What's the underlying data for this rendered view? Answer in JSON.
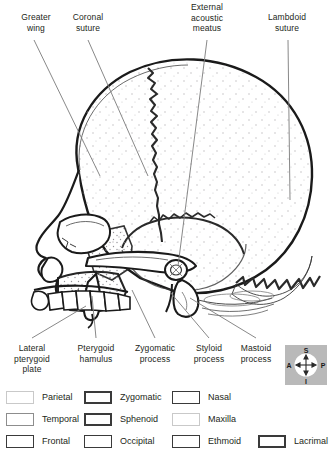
{
  "diagram": {
    "top_labels": [
      {
        "id": "greater-wing",
        "text": "Greater\nwing",
        "x": 10,
        "y": 12,
        "w": 52
      },
      {
        "id": "coronal-suture",
        "text": "Coronal\nsuture",
        "x": 62,
        "y": 12,
        "w": 52
      },
      {
        "id": "external-acoustic-meatus",
        "text": "External\nacoustic\nmeatus",
        "x": 178,
        "y": 2,
        "w": 58
      },
      {
        "id": "lambdoid-suture",
        "text": "Lambdoid\nsuture",
        "x": 258,
        "y": 12,
        "w": 58
      }
    ],
    "bottom_labels": [
      {
        "id": "lateral-pterygoid-plate",
        "text": "Lateral\npterygoid\nplate",
        "x": 6,
        "y": 343,
        "w": 52
      },
      {
        "id": "pterygoid-hamulus",
        "text": "Pterygoid\nhamulus",
        "x": 68,
        "y": 343,
        "w": 56
      },
      {
        "id": "zygomatic-process",
        "text": "Zygomatic\nprocess",
        "x": 127,
        "y": 343,
        "w": 56
      },
      {
        "id": "styloid-process",
        "text": "Styloid\nprocess",
        "x": 186,
        "y": 343,
        "w": 46
      },
      {
        "id": "mastoid-process",
        "text": "Mastoid\nprocess",
        "x": 231,
        "y": 343,
        "w": 50
      }
    ]
  },
  "compass": {
    "superior": "S",
    "inferior": "I",
    "anterior": "A",
    "posterior": "P"
  },
  "legend": {
    "rows": [
      [
        {
          "id": "parietal",
          "label": "Parietal",
          "swatch": "sw-light",
          "x": 6,
          "tx": 0
        },
        {
          "id": "zygomatic",
          "label": "Zygomatic",
          "swatch": "sw-heavy",
          "x": 84,
          "tx": 0
        },
        {
          "id": "nasal",
          "label": "Nasal",
          "swatch": "sw-dark",
          "x": 172,
          "tx": 0
        }
      ],
      [
        {
          "id": "temporal",
          "label": "Temporal",
          "swatch": "sw-mid",
          "x": 6,
          "tx": 0
        },
        {
          "id": "sphenoid",
          "label": "Sphenoid",
          "swatch": "sw-heavy",
          "x": 84,
          "tx": 0
        },
        {
          "id": "maxilla",
          "label": "Maxilla",
          "swatch": "sw-light",
          "x": 172,
          "tx": 0
        }
      ],
      [
        {
          "id": "frontal",
          "label": "Frontal",
          "swatch": "sw-dark",
          "x": 6,
          "tx": 0
        },
        {
          "id": "occipital",
          "label": "Occipital",
          "swatch": "sw-dark",
          "x": 84,
          "tx": 0
        },
        {
          "id": "ethmoid",
          "label": "Ethmoid",
          "swatch": "sw-dark",
          "x": 172,
          "tx": 0
        },
        {
          "id": "lacrimal",
          "label": "Lacrimal",
          "swatch": "sw-heavy",
          "x": 258,
          "tx": 0
        }
      ]
    ]
  },
  "colors": {
    "ink": "#231f20",
    "outline": "#1a1a1a",
    "leader": "#6f6f6f",
    "stipple": "#b0aeb4",
    "compass_bg": "#b9b9b9",
    "page_bg": "#ffffff"
  }
}
